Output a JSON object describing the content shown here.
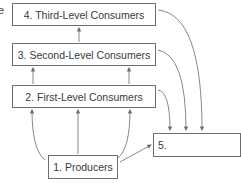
{
  "diagram": {
    "type": "food-chain flow diagram",
    "left_edge_fragment": "e",
    "nodes": [
      {
        "id": "n4",
        "label": "4. Third-Level Consumers"
      },
      {
        "id": "n3",
        "label": "3. Second-Level Consumers"
      },
      {
        "id": "n2",
        "label": "2. First-Level Consumers"
      },
      {
        "id": "n1",
        "label": "1. Producers"
      },
      {
        "id": "n5",
        "label": "5."
      }
    ],
    "edges": [
      {
        "from": "n1",
        "to": "n2",
        "count": 3
      },
      {
        "from": "n2",
        "to": "n3",
        "count": 2
      },
      {
        "from": "n3",
        "to": "n4",
        "count": 1
      },
      {
        "from": "n1",
        "to": "n5"
      },
      {
        "from": "n2",
        "to": "n5"
      },
      {
        "from": "n3",
        "to": "n5"
      },
      {
        "from": "n4",
        "to": "n5"
      }
    ],
    "colors": {
      "line": "#6e6e6e",
      "text": "#3a3a3a",
      "background": "#ffffff"
    }
  }
}
